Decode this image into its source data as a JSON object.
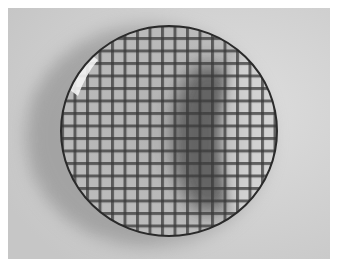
{
  "image": {
    "description": "Grayscale photograph of a round glass dish on a light surface with a square grid visible through it, casting a soft shadow",
    "frame_color": "#ffffff",
    "background_color": "#cfcfcf",
    "dish": {
      "center": [
        161,
        123
      ],
      "radius_x": 109,
      "radius_y": 106,
      "rim_color": "#2a2a2a",
      "fill_color": "#b9b9b9",
      "grid_line_color": "#3a3a3a",
      "grid_spacing": 12.5
    },
    "shadow_color": "#9a9a9a",
    "crescent_shadow_color": "#555555",
    "highlight_color": "#f4f4f4"
  }
}
